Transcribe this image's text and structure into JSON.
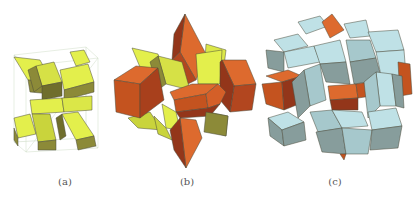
{
  "figure": {
    "panels": [
      {
        "id": "a",
        "label": "(a)",
        "description": "Yellow-green zonohedral X-shaped cluster inside a wireframe cube"
      },
      {
        "id": "b",
        "label": "(b)",
        "description": "Yellow-green X cluster with orange rhombic prisms attached, star-like shape"
      },
      {
        "id": "c",
        "label": "(c)",
        "description": "Light blue rhombic polyhedra enclosing orange and yellow components"
      }
    ],
    "colors": {
      "yellow_light": "#e3ef4c",
      "yellow_mid": "#c9d43c",
      "yellow_dark": "#8c8a38",
      "orange_light": "#dd6a2e",
      "orange_mid": "#c4531f",
      "orange_dark": "#93361a",
      "blue_light": "#bfe1e6",
      "blue_mid": "#a6c8cc",
      "blue_dark": "#879d9c",
      "cube_wire": "#c8d8c0"
    }
  }
}
